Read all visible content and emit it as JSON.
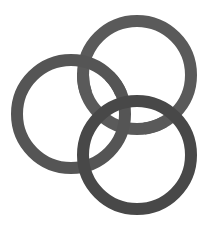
{
  "diagram": {
    "type": "interlocking-rings",
    "ring_count": 3,
    "background": "#ffffff",
    "rings": [
      {
        "name": "top",
        "cx": 137,
        "cy": 75,
        "r": 54,
        "stroke_width": 12,
        "color": "#5a5a5a"
      },
      {
        "name": "left",
        "cx": 71,
        "cy": 114,
        "r": 54,
        "stroke_width": 12,
        "color": "#555555"
      },
      {
        "name": "bottom",
        "cx": 137,
        "cy": 155,
        "r": 54,
        "stroke_width": 12,
        "color": "#484848"
      }
    ]
  }
}
